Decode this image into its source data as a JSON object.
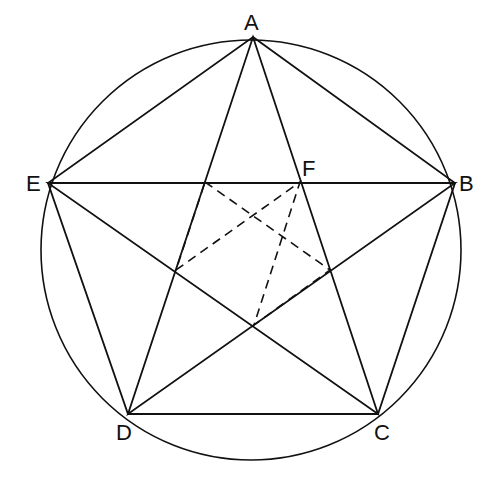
{
  "diagram": {
    "type": "geometry",
    "circle": {
      "cx": 251,
      "cy": 250,
      "r": 210
    },
    "points": {
      "A": {
        "label": "A",
        "x": 253,
        "y": 37
      },
      "B": {
        "label": "B",
        "x": 455,
        "y": 183
      },
      "C": {
        "label": "C",
        "x": 378,
        "y": 414
      },
      "D": {
        "label": "D",
        "x": 128,
        "y": 414
      },
      "E": {
        "label": "E",
        "x": 48,
        "y": 183
      },
      "F": {
        "label": "F",
        "x": 300,
        "y": 182
      }
    },
    "inner_pentagon": [
      [
        205,
        182
      ],
      [
        300,
        182
      ],
      [
        330,
        270
      ],
      [
        254,
        325
      ],
      [
        176,
        270
      ]
    ],
    "labels": {
      "A": "A",
      "B": "B",
      "C": "C",
      "D": "D",
      "E": "E",
      "F": "F"
    },
    "colors": {
      "stroke": "#111111",
      "background": "#ffffff"
    }
  }
}
